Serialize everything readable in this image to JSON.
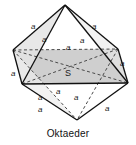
{
  "figure": {
    "caption": "Oktaeder",
    "center_point_label": "S",
    "edge_length_symbol": "a",
    "colors": {
      "stroke": "#111111",
      "dashed_stroke": "#555555",
      "equator_fill": "#cfcfcf",
      "face_fill_light": "#e8e8e8",
      "background": "#ffffff",
      "text": "#111111"
    },
    "vertices": [
      {
        "name": "top",
        "x": 65,
        "y": 5
      },
      {
        "name": "back",
        "x": 13,
        "y": 50
      },
      {
        "name": "right-back",
        "x": 118,
        "y": 49
      },
      {
        "name": "left-front",
        "x": 22,
        "y": 84
      },
      {
        "name": "right-front",
        "x": 128,
        "y": 83
      },
      {
        "name": "bottom",
        "x": 77,
        "y": 120
      }
    ],
    "edge_labels": [
      {
        "id": "upper-left-outer",
        "text": "a",
        "x": 31,
        "y": 23
      },
      {
        "id": "upper-left-inner",
        "text": "a",
        "x": 42,
        "y": 36
      },
      {
        "id": "upper-right-inner",
        "text": "a",
        "x": 80,
        "y": 37
      },
      {
        "id": "upper-right-outer",
        "text": "a",
        "x": 92,
        "y": 23
      },
      {
        "id": "equator-back",
        "text": "a",
        "x": 66,
        "y": 44
      },
      {
        "id": "equator-left",
        "text": "a",
        "x": 11,
        "y": 70
      },
      {
        "id": "equator-right",
        "text": "a",
        "x": 120,
        "y": 60
      },
      {
        "id": "lower-back-left",
        "text": "a",
        "x": 56,
        "y": 88
      },
      {
        "id": "lower-inner-left",
        "text": "a",
        "x": 38,
        "y": 94
      },
      {
        "id": "lower-inner-right",
        "text": "a",
        "x": 74,
        "y": 94
      },
      {
        "id": "lower-front-left",
        "text": "a",
        "x": 38,
        "y": 106
      },
      {
        "id": "lower-front-right",
        "text": "a",
        "x": 105,
        "y": 105
      }
    ]
  }
}
